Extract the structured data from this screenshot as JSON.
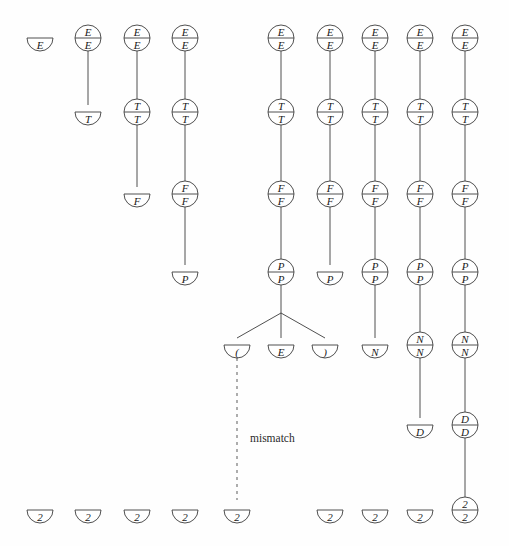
{
  "figure": {
    "stroke_color": "#3c3c3c",
    "text_color": "#1a1a1a",
    "background": "#fefefe",
    "node_radius": 13,
    "annotations": [
      {
        "name": "mismatch-label",
        "text": "mismatch",
        "x": 250,
        "y": 438
      }
    ],
    "dashed_connector": {
      "name": "mismatch-connector",
      "x": 237,
      "y1": 358,
      "y2": 500,
      "dash": "3,4"
    },
    "columns": [
      {
        "index": 0,
        "x": 40
      },
      {
        "index": 1,
        "x": 88
      },
      {
        "index": 2,
        "x": 137
      },
      {
        "index": 3,
        "x": 185
      },
      {
        "index": 4,
        "x": 237
      },
      {
        "index": 5,
        "x": 281
      },
      {
        "index": 6,
        "x": 330
      },
      {
        "index": 7,
        "x": 375
      },
      {
        "index": 8,
        "x": 420
      },
      {
        "index": 9,
        "x": 465
      }
    ],
    "rows": [
      {
        "name": "row-E",
        "y": 38
      },
      {
        "name": "row-T",
        "y": 112
      },
      {
        "name": "row-F",
        "y": 194
      },
      {
        "name": "row-P",
        "y": 272
      },
      {
        "name": "row-N",
        "y": 345
      },
      {
        "name": "row-D",
        "y": 425
      },
      {
        "name": "row-2",
        "y": 510
      }
    ],
    "nodes": [
      {
        "id": "n0",
        "name": "node-E-half-col0",
        "x": 40,
        "y": 38,
        "shape": "half",
        "top": "",
        "bottom": "E"
      },
      {
        "id": "n1",
        "name": "node-E-full-col1",
        "x": 88,
        "y": 38,
        "shape": "full",
        "top": "E",
        "bottom": "E"
      },
      {
        "id": "n2",
        "name": "node-T-half-col1",
        "x": 88,
        "y": 112,
        "shape": "half",
        "top": "",
        "bottom": "T"
      },
      {
        "id": "n3",
        "name": "node-E-full-col2",
        "x": 137,
        "y": 38,
        "shape": "full",
        "top": "E",
        "bottom": "E"
      },
      {
        "id": "n4",
        "name": "node-T-full-col2",
        "x": 137,
        "y": 112,
        "shape": "full",
        "top": "T",
        "bottom": "T"
      },
      {
        "id": "n5",
        "name": "node-F-half-col2",
        "x": 137,
        "y": 194,
        "shape": "half",
        "top": "",
        "bottom": "F"
      },
      {
        "id": "n6",
        "name": "node-E-full-col3",
        "x": 185,
        "y": 38,
        "shape": "full",
        "top": "E",
        "bottom": "E"
      },
      {
        "id": "n7",
        "name": "node-T-full-col3",
        "x": 185,
        "y": 112,
        "shape": "full",
        "top": "T",
        "bottom": "T"
      },
      {
        "id": "n8",
        "name": "node-F-full-col3",
        "x": 185,
        "y": 194,
        "shape": "full",
        "top": "F",
        "bottom": "F"
      },
      {
        "id": "n9",
        "name": "node-P-half-col3",
        "x": 185,
        "y": 272,
        "shape": "half",
        "top": "",
        "bottom": "P"
      },
      {
        "id": "n10",
        "name": "node-E-full-col5",
        "x": 281,
        "y": 38,
        "shape": "full",
        "top": "E",
        "bottom": "E"
      },
      {
        "id": "n11",
        "name": "node-T-full-col5",
        "x": 281,
        "y": 112,
        "shape": "full",
        "top": "T",
        "bottom": "T"
      },
      {
        "id": "n12",
        "name": "node-F-full-col5",
        "x": 281,
        "y": 194,
        "shape": "full",
        "top": "F",
        "bottom": "F"
      },
      {
        "id": "n13",
        "name": "node-P-full-col5",
        "x": 281,
        "y": 272,
        "shape": "full",
        "top": "P",
        "bottom": "P"
      },
      {
        "id": "n14",
        "name": "node-lparen-half",
        "x": 237,
        "y": 345,
        "shape": "half",
        "top": "",
        "bottom": "("
      },
      {
        "id": "n15",
        "name": "node-E-half-mid",
        "x": 281,
        "y": 345,
        "shape": "half",
        "top": "",
        "bottom": "E"
      },
      {
        "id": "n16",
        "name": "node-rparen-half",
        "x": 325,
        "y": 345,
        "shape": "half",
        "top": "",
        "bottom": ")"
      },
      {
        "id": "n17",
        "name": "node-E-full-col6",
        "x": 330,
        "y": 38,
        "shape": "full",
        "top": "E",
        "bottom": "E"
      },
      {
        "id": "n18",
        "name": "node-T-full-col6",
        "x": 330,
        "y": 112,
        "shape": "full",
        "top": "T",
        "bottom": "T"
      },
      {
        "id": "n19",
        "name": "node-F-full-col6",
        "x": 330,
        "y": 194,
        "shape": "full",
        "top": "F",
        "bottom": "F"
      },
      {
        "id": "n20",
        "name": "node-P-half-col6",
        "x": 330,
        "y": 272,
        "shape": "half",
        "top": "",
        "bottom": "P"
      },
      {
        "id": "n21",
        "name": "node-E-full-col7",
        "x": 375,
        "y": 38,
        "shape": "full",
        "top": "E",
        "bottom": "E"
      },
      {
        "id": "n22",
        "name": "node-T-full-col7",
        "x": 375,
        "y": 112,
        "shape": "full",
        "top": "T",
        "bottom": "T"
      },
      {
        "id": "n23",
        "name": "node-F-full-col7",
        "x": 375,
        "y": 194,
        "shape": "full",
        "top": "F",
        "bottom": "F"
      },
      {
        "id": "n24",
        "name": "node-P-full-col7",
        "x": 375,
        "y": 272,
        "shape": "full",
        "top": "P",
        "bottom": "P"
      },
      {
        "id": "n25",
        "name": "node-N-half-col7",
        "x": 375,
        "y": 345,
        "shape": "half",
        "top": "",
        "bottom": "N"
      },
      {
        "id": "n26",
        "name": "node-E-full-col8",
        "x": 420,
        "y": 38,
        "shape": "full",
        "top": "E",
        "bottom": "E"
      },
      {
        "id": "n27",
        "name": "node-T-full-col8",
        "x": 420,
        "y": 112,
        "shape": "full",
        "top": "T",
        "bottom": "T"
      },
      {
        "id": "n28",
        "name": "node-F-full-col8",
        "x": 420,
        "y": 194,
        "shape": "full",
        "top": "F",
        "bottom": "F"
      },
      {
        "id": "n29",
        "name": "node-P-full-col8",
        "x": 420,
        "y": 272,
        "shape": "full",
        "top": "P",
        "bottom": "P"
      },
      {
        "id": "n30",
        "name": "node-N-full-col8",
        "x": 420,
        "y": 345,
        "shape": "full",
        "top": "N",
        "bottom": "N"
      },
      {
        "id": "n31",
        "name": "node-D-half-col8",
        "x": 420,
        "y": 425,
        "shape": "half",
        "top": "",
        "bottom": "D"
      },
      {
        "id": "n32",
        "name": "node-E-full-col9",
        "x": 465,
        "y": 38,
        "shape": "full",
        "top": "E",
        "bottom": "E"
      },
      {
        "id": "n33",
        "name": "node-T-full-col9",
        "x": 465,
        "y": 112,
        "shape": "full",
        "top": "T",
        "bottom": "T"
      },
      {
        "id": "n34",
        "name": "node-F-full-col9",
        "x": 465,
        "y": 194,
        "shape": "full",
        "top": "F",
        "bottom": "F"
      },
      {
        "id": "n35",
        "name": "node-P-full-col9",
        "x": 465,
        "y": 272,
        "shape": "full",
        "top": "P",
        "bottom": "P"
      },
      {
        "id": "n36",
        "name": "node-N-full-col9",
        "x": 465,
        "y": 345,
        "shape": "full",
        "top": "N",
        "bottom": "N"
      },
      {
        "id": "n37",
        "name": "node-D-full-col9",
        "x": 465,
        "y": 425,
        "shape": "full",
        "top": "D",
        "bottom": "D"
      },
      {
        "id": "n38",
        "name": "node-2-full-col9",
        "x": 465,
        "y": 510,
        "shape": "full",
        "top": "2",
        "bottom": "2"
      },
      {
        "id": "t0",
        "name": "node-2-half-col0",
        "x": 40,
        "y": 510,
        "shape": "half",
        "top": "",
        "bottom": "2"
      },
      {
        "id": "t1",
        "name": "node-2-half-col1",
        "x": 88,
        "y": 510,
        "shape": "half",
        "top": "",
        "bottom": "2"
      },
      {
        "id": "t2",
        "name": "node-2-half-col2",
        "x": 137,
        "y": 510,
        "shape": "half",
        "top": "",
        "bottom": "2"
      },
      {
        "id": "t3",
        "name": "node-2-half-col3",
        "x": 185,
        "y": 510,
        "shape": "half",
        "top": "",
        "bottom": "2"
      },
      {
        "id": "t4",
        "name": "node-2-half-col4",
        "x": 237,
        "y": 510,
        "shape": "half",
        "top": "",
        "bottom": "2"
      },
      {
        "id": "t5",
        "name": "node-2-half-col6",
        "x": 330,
        "y": 510,
        "shape": "half",
        "top": "",
        "bottom": "2"
      },
      {
        "id": "t6",
        "name": "node-2-half-col7",
        "x": 375,
        "y": 510,
        "shape": "half",
        "top": "",
        "bottom": "2"
      },
      {
        "id": "t7",
        "name": "node-2-half-col8",
        "x": 420,
        "y": 510,
        "shape": "half",
        "top": "",
        "bottom": "2"
      }
    ],
    "edges": [
      {
        "name": "edge-col1-E-T",
        "x1": 88,
        "y1": 51,
        "x2": 88,
        "y2": 105
      },
      {
        "name": "edge-col2-E-T",
        "x1": 137,
        "y1": 51,
        "x2": 137,
        "y2": 99
      },
      {
        "name": "edge-col2-T-F",
        "x1": 137,
        "y1": 125,
        "x2": 137,
        "y2": 187
      },
      {
        "name": "edge-col3-E-T",
        "x1": 185,
        "y1": 51,
        "x2": 185,
        "y2": 99
      },
      {
        "name": "edge-col3-T-F",
        "x1": 185,
        "y1": 125,
        "x2": 185,
        "y2": 181
      },
      {
        "name": "edge-col3-F-P",
        "x1": 185,
        "y1": 207,
        "x2": 185,
        "y2": 265
      },
      {
        "name": "edge-col5-E-T",
        "x1": 281,
        "y1": 51,
        "x2": 281,
        "y2": 99
      },
      {
        "name": "edge-col5-T-F",
        "x1": 281,
        "y1": 125,
        "x2": 281,
        "y2": 181
      },
      {
        "name": "edge-col5-F-P",
        "x1": 281,
        "y1": 207,
        "x2": 281,
        "y2": 259
      },
      {
        "name": "edge-col5-P-fan-stem",
        "x1": 281,
        "y1": 285,
        "x2": 281,
        "y2": 313
      },
      {
        "name": "edge-col5-fan-left",
        "x1": 281,
        "y1": 313,
        "x2": 237,
        "y2": 338
      },
      {
        "name": "edge-col5-fan-mid",
        "x1": 281,
        "y1": 313,
        "x2": 281,
        "y2": 338
      },
      {
        "name": "edge-col5-fan-right",
        "x1": 281,
        "y1": 313,
        "x2": 325,
        "y2": 338
      },
      {
        "name": "edge-col6-E-T",
        "x1": 330,
        "y1": 51,
        "x2": 330,
        "y2": 99
      },
      {
        "name": "edge-col6-T-F",
        "x1": 330,
        "y1": 125,
        "x2": 330,
        "y2": 181
      },
      {
        "name": "edge-col6-F-P",
        "x1": 330,
        "y1": 207,
        "x2": 330,
        "y2": 265
      },
      {
        "name": "edge-col7-E-T",
        "x1": 375,
        "y1": 51,
        "x2": 375,
        "y2": 99
      },
      {
        "name": "edge-col7-T-F",
        "x1": 375,
        "y1": 125,
        "x2": 375,
        "y2": 181
      },
      {
        "name": "edge-col7-F-P",
        "x1": 375,
        "y1": 207,
        "x2": 375,
        "y2": 259
      },
      {
        "name": "edge-col7-P-N",
        "x1": 375,
        "y1": 285,
        "x2": 375,
        "y2": 338
      },
      {
        "name": "edge-col8-E-T",
        "x1": 420,
        "y1": 51,
        "x2": 420,
        "y2": 99
      },
      {
        "name": "edge-col8-T-F",
        "x1": 420,
        "y1": 125,
        "x2": 420,
        "y2": 181
      },
      {
        "name": "edge-col8-F-P",
        "x1": 420,
        "y1": 207,
        "x2": 420,
        "y2": 259
      },
      {
        "name": "edge-col8-P-N",
        "x1": 420,
        "y1": 285,
        "x2": 420,
        "y2": 332
      },
      {
        "name": "edge-col8-N-D",
        "x1": 420,
        "y1": 358,
        "x2": 420,
        "y2": 418
      },
      {
        "name": "edge-col9-E-T",
        "x1": 465,
        "y1": 51,
        "x2": 465,
        "y2": 99
      },
      {
        "name": "edge-col9-T-F",
        "x1": 465,
        "y1": 125,
        "x2": 465,
        "y2": 181
      },
      {
        "name": "edge-col9-F-P",
        "x1": 465,
        "y1": 207,
        "x2": 465,
        "y2": 259
      },
      {
        "name": "edge-col9-P-N",
        "x1": 465,
        "y1": 285,
        "x2": 465,
        "y2": 332
      },
      {
        "name": "edge-col9-N-D",
        "x1": 465,
        "y1": 358,
        "x2": 465,
        "y2": 412
      },
      {
        "name": "edge-col9-D-2",
        "x1": 465,
        "y1": 438,
        "x2": 465,
        "y2": 497
      }
    ]
  }
}
